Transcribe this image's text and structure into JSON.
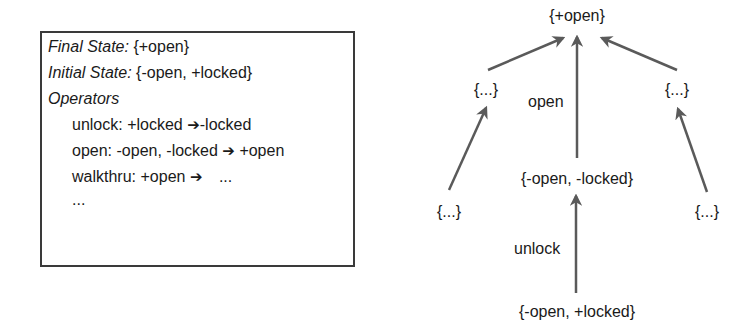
{
  "problem": {
    "final_state_label": "Final State:",
    "final_state_value": "{+open}",
    "initial_state_label": "Initial State:",
    "initial_state_value": "{-open, +locked}",
    "operators_label": "Operators",
    "operators": [
      {
        "name": "unlock:",
        "pre": "+locked",
        "arrow": "➔",
        "post": "-locked"
      },
      {
        "name": "open:",
        "pre": "-open, -locked",
        "arrow": "➔",
        "post": "+open"
      },
      {
        "name": "walkthru:",
        "pre": "+open",
        "arrow": "➔",
        "post": "..."
      }
    ],
    "ellipsis": "..."
  },
  "graph": {
    "nodes": {
      "goal": "{+open}",
      "left_upper": "{...}",
      "right_upper": "{...}",
      "middle": "{-open, -locked}",
      "left_lower": "{...}",
      "right_lower": "{...}",
      "start": "{-open, +locked}"
    },
    "edge_labels": {
      "open": "open",
      "unlock": "unlock"
    },
    "colors": {
      "edge": "#5a5a5a",
      "text": "#1a1a1a"
    }
  }
}
